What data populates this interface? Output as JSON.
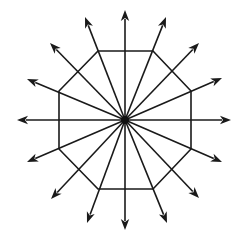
{
  "diagram": {
    "type": "octagon-with-radiating-arrows",
    "center": [
      125,
      120
    ],
    "colors": {
      "stroke": "#1a1a1a",
      "hub": "#111111",
      "background": "#ffffff"
    },
    "octagon": {
      "vertices": [
        [
          98,
          51
        ],
        [
          153,
          51
        ],
        [
          191,
          91
        ],
        [
          191,
          149
        ],
        [
          153,
          189
        ],
        [
          98,
          189
        ],
        [
          59,
          149
        ],
        [
          59,
          91
        ]
      ]
    },
    "arrows": [
      {
        "direction": "N",
        "tip": [
          125,
          10
        ]
      },
      {
        "direction": "NNE",
        "tip": [
          166,
          17
        ]
      },
      {
        "direction": "NE",
        "tip": [
          199,
          43
        ]
      },
      {
        "direction": "ENE",
        "tip": [
          222,
          78
        ]
      },
      {
        "direction": "E",
        "tip": [
          231,
          120
        ]
      },
      {
        "direction": "ESE",
        "tip": [
          222,
          162
        ]
      },
      {
        "direction": "SE",
        "tip": [
          199,
          198
        ]
      },
      {
        "direction": "SSE",
        "tip": [
          167,
          223
        ]
      },
      {
        "direction": "S",
        "tip": [
          125,
          230
        ]
      },
      {
        "direction": "SSW",
        "tip": [
          87,
          223
        ]
      },
      {
        "direction": "SW",
        "tip": [
          51,
          199
        ]
      },
      {
        "direction": "WSW",
        "tip": [
          27,
          162
        ]
      },
      {
        "direction": "W",
        "tip": [
          17,
          120
        ]
      },
      {
        "direction": "WNW",
        "tip": [
          27,
          79
        ]
      },
      {
        "direction": "NW",
        "tip": [
          50,
          43
        ]
      },
      {
        "direction": "NNW",
        "tip": [
          85,
          17
        ]
      }
    ],
    "arrow_count": 16,
    "polygon_sides": 8
  }
}
